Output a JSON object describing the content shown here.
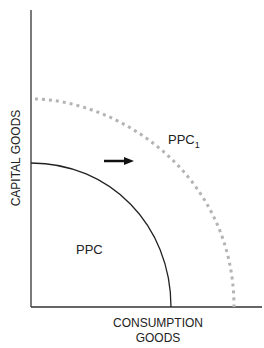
{
  "diagram": {
    "y_axis_label": "CAPITAL GOODS",
    "x_axis_label_line1": "CONSUMPTION",
    "x_axis_label_line2": "GOODS",
    "curves": [
      {
        "label": "PPC",
        "style": "solid",
        "color": "#222222"
      },
      {
        "label_main": "PPC",
        "label_sub": "1",
        "style": "dotted",
        "color": "#b4b4b4"
      }
    ],
    "arrow": {
      "direction": "right",
      "meaning": "outward shift"
    }
  },
  "colors": {
    "axis": "#333333",
    "ppc": "#222222",
    "ppc1": "#b4b4b4",
    "text": "#222222"
  }
}
